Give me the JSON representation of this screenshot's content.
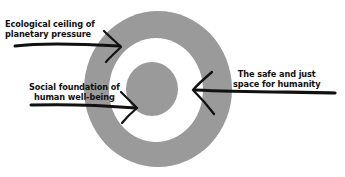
{
  "diagram": {
    "type": "doughnut-model",
    "colors": {
      "ring": "#9a9a9a",
      "background": "#ffffff",
      "ink": "#111111"
    },
    "labels": {
      "ceiling_line1": "Ecological ceiling of",
      "ceiling_line2": "planetary pressure",
      "foundation_line1": "Social foundation of",
      "foundation_line2": "human well-being",
      "safe_line1": "The safe and just",
      "safe_line2": "space for humanity"
    },
    "arrows": [
      {
        "name": "ceiling-arrow",
        "points_to": "outer ring"
      },
      {
        "name": "foundation-arrow",
        "points_to": "inner circle"
      },
      {
        "name": "safe-space-arrow",
        "points_to": "white ring"
      }
    ]
  }
}
